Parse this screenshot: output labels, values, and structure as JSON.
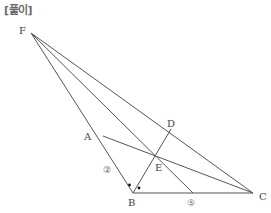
{
  "header": {
    "title": "[풀이]"
  },
  "diagram": {
    "points": [
      {
        "name": "F",
        "x": 31,
        "y": 33
      },
      {
        "name": "A",
        "x": 103,
        "y": 136
      },
      {
        "name": "B",
        "x": 133,
        "y": 193
      },
      {
        "name": "C",
        "x": 253,
        "y": 193
      },
      {
        "name": "D",
        "x": 171,
        "y": 129
      },
      {
        "name": "E",
        "x": 156,
        "y": 158
      }
    ],
    "segments": [
      [
        "F",
        "B"
      ],
      [
        "F",
        "C"
      ],
      [
        "B",
        "C"
      ],
      [
        "A",
        "C"
      ],
      [
        "B",
        "D"
      ],
      [
        "F",
        "G"
      ]
    ],
    "labels": {
      "F": "F",
      "A": "A",
      "B": "B",
      "C": "C",
      "D": "D",
      "E": "E",
      "AB_length": "②",
      "BC_length": "⑤"
    },
    "angle_marks": "Equal-angle dots at B (BD bisects angle ABC)"
  }
}
